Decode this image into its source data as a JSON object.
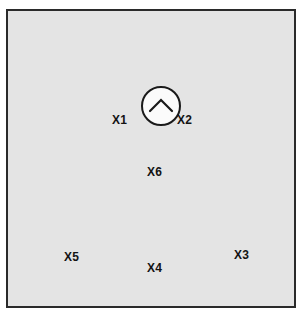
{
  "diagram": {
    "title": "",
    "panel": {
      "fill_color": "#e4e4e4",
      "border_color": "#2a2a2a"
    },
    "node": {
      "shape": "circle",
      "fill_color": "#fbfbfb",
      "border_color": "#1a1a1a",
      "icon": "chevron-up-icon",
      "icon_color": "#1a1a1a",
      "center_x": 153,
      "center_y": 95,
      "diameter": 40
    },
    "labels": [
      {
        "id": "X1",
        "text": "X1",
        "x": 110,
        "y": 112
      },
      {
        "id": "X2",
        "text": "X2",
        "x": 175,
        "y": 112
      },
      {
        "id": "X6",
        "text": "X6",
        "x": 145,
        "y": 164
      },
      {
        "id": "X5",
        "text": "X5",
        "x": 62,
        "y": 249
      },
      {
        "id": "X4",
        "text": "X4",
        "x": 145,
        "y": 260
      },
      {
        "id": "X3",
        "text": "X3",
        "x": 232,
        "y": 247
      }
    ]
  }
}
